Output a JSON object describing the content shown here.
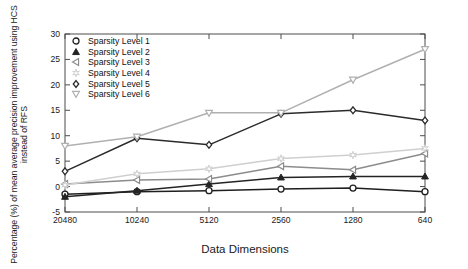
{
  "chart_data": {
    "type": "line",
    "title": "",
    "xlabel": "Data Dimensions",
    "ylabel": "Percentage (%) of mean average precision improvement using HCS instead of RFS",
    "categories": [
      "20480",
      "10240",
      "5120",
      "2560",
      "1280",
      "640"
    ],
    "x_tick_labels": [
      "20480",
      "10240",
      "5120",
      "2560",
      "1280",
      "640"
    ],
    "y_tick_labels": [
      "-5",
      "0",
      "5",
      "10",
      "15",
      "20",
      "25",
      "30"
    ],
    "y_ticks": [
      -5,
      0,
      5,
      10,
      15,
      20,
      25,
      30
    ],
    "ylim": [
      -5,
      30
    ],
    "xlim_index": [
      0,
      5
    ],
    "grid": false,
    "legend_position": "upper-left-inside",
    "series": [
      {
        "name": "Sparsity Level 1",
        "marker": "circle",
        "color": "#1f1f1f",
        "values": [
          -1.5,
          -1.0,
          -0.8,
          -0.5,
          -0.3,
          -1.0
        ]
      },
      {
        "name": "Sparsity Level 2",
        "marker": "triangle-up",
        "color": "#242424",
        "values": [
          -2.0,
          -0.8,
          0.5,
          1.8,
          2.0,
          2.0
        ]
      },
      {
        "name": "Sparsity Level 3",
        "marker": "triangle-left",
        "color": "#8c8c8c",
        "values": [
          0.5,
          1.3,
          1.5,
          4.0,
          3.3,
          6.5
        ]
      },
      {
        "name": "Sparsity Level 4",
        "marker": "star",
        "color": "#cfcfcf",
        "values": [
          0.3,
          2.5,
          3.5,
          5.5,
          6.2,
          7.5
        ]
      },
      {
        "name": "Sparsity Level 5",
        "marker": "diamond",
        "color": "#2b2b2b",
        "values": [
          3.0,
          9.5,
          8.2,
          14.3,
          15.0,
          13.0
        ]
      },
      {
        "name": "Sparsity Level 6",
        "marker": "triangle-down",
        "color": "#b0b0b0",
        "values": [
          8.0,
          9.8,
          14.5,
          14.5,
          21.0,
          27.0
        ]
      }
    ]
  },
  "figure": {
    "background_color": "#ffffff",
    "axis_color": "#4d4d4d",
    "text_color": "#1a1a1a"
  }
}
